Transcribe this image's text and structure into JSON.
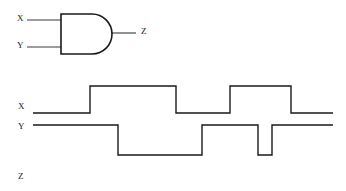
{
  "diagram": {
    "gate": {
      "type": "AND",
      "name": "and-gate",
      "inputs": [
        {
          "label": "X",
          "label_x": 17,
          "label_y": 23,
          "wire_x1": 27,
          "wire_x2": 61,
          "wire_y": 20
        },
        {
          "label": "Y",
          "label_x": 17,
          "label_y": 50,
          "wire_x1": 27,
          "wire_x2": 61,
          "wire_y": 47
        }
      ],
      "output": {
        "label": "Z",
        "label_x": 141,
        "label_y": 36,
        "wire_x1": 112,
        "wire_x2": 136,
        "wire_y": 33
      },
      "body": {
        "x": 61,
        "y": 14,
        "width": 51,
        "height": 40
      }
    },
    "timing": {
      "signals": [
        {
          "name": "X",
          "label": "X",
          "label_x": 18,
          "label_y": 111,
          "high_y": 86,
          "low_y": 113,
          "x_start": 33,
          "x_end": 333,
          "initial_level": "low",
          "transitions": [
            {
              "x": 90,
              "to": "high"
            },
            {
              "x": 176,
              "to": "low"
            },
            {
              "x": 230,
              "to": "high"
            },
            {
              "x": 291,
              "to": "low"
            }
          ]
        },
        {
          "name": "Y",
          "label": "Y",
          "label_x": 18,
          "label_y": 131,
          "high_y": 125,
          "low_y": 155,
          "x_start": 33,
          "x_end": 333,
          "initial_level": "high",
          "transitions": [
            {
              "x": 118,
              "to": "low"
            },
            {
              "x": 202,
              "to": "high"
            },
            {
              "x": 258,
              "to": "low"
            },
            {
              "x": 272,
              "to": "high"
            }
          ]
        },
        {
          "name": "Z",
          "label": "Z",
          "label_x": 18,
          "label_y": 181,
          "high_y": 168,
          "low_y": 186,
          "x_start": 33,
          "x_end": 333,
          "initial_level": "none",
          "transitions": []
        }
      ]
    },
    "colors": {
      "ink": "#1a1a1a",
      "wire": "#3a3a3a",
      "background": "#ffffff"
    }
  }
}
